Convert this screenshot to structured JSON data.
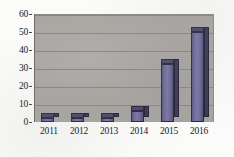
{
  "chart_data": {
    "type": "bar",
    "title": "",
    "subtitle": "",
    "xlabel": "",
    "ylabel": "",
    "categories": [
      "2011",
      "2012",
      "2013",
      "2014",
      "2015",
      "2016"
    ],
    "values": [
      1,
      1,
      1,
      6,
      32,
      50
    ],
    "series": [
      {
        "name": "Series 1",
        "values": [
          1,
          1,
          1,
          6,
          32,
          50
        ]
      }
    ],
    "ylim": [
      0,
      60
    ],
    "yticks": [
      "0",
      "10",
      "20",
      "30",
      "40",
      "50",
      "60"
    ],
    "ytick_values": [
      0,
      10,
      20,
      30,
      40,
      50,
      60
    ],
    "grid": true,
    "legend": false,
    "legend_position": "none",
    "style": "3d-bar",
    "colors": {
      "bar_face": "#6f6c98",
      "bar_side": "#3b3954",
      "bar_top": "#4b4968",
      "bar_outline": "#2b2940",
      "plot_background": "#a9a6a2",
      "gridline": "#8a8783",
      "axis": "#4a4845",
      "text": "#15161a",
      "figure_background": "#fbfbfa"
    }
  }
}
